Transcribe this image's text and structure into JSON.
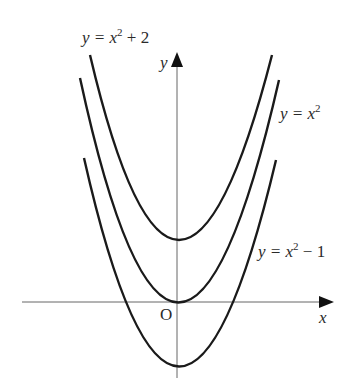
{
  "figure": {
    "axes": {
      "x_label": "x",
      "y_label": "y",
      "origin_label": "O"
    },
    "curves": [
      {
        "id": "top",
        "equation": "y = x² + 2",
        "label_prefix": "y = x",
        "label_sup": "2",
        "label_suffix": " + 2",
        "vertex_offset": 2
      },
      {
        "id": "middle",
        "equation": "y = x²",
        "label_prefix": "y = x",
        "label_sup": "2",
        "label_suffix": "",
        "vertex_offset": 0
      },
      {
        "id": "bottom",
        "equation": "y = x² − 1",
        "label_prefix": "y = x",
        "label_sup": "2",
        "label_suffix": " − 1",
        "vertex_offset": -1
      }
    ],
    "colors": {
      "curve": "#1a1a1a",
      "axis": "#555555",
      "text": "#2a2a2a"
    }
  }
}
